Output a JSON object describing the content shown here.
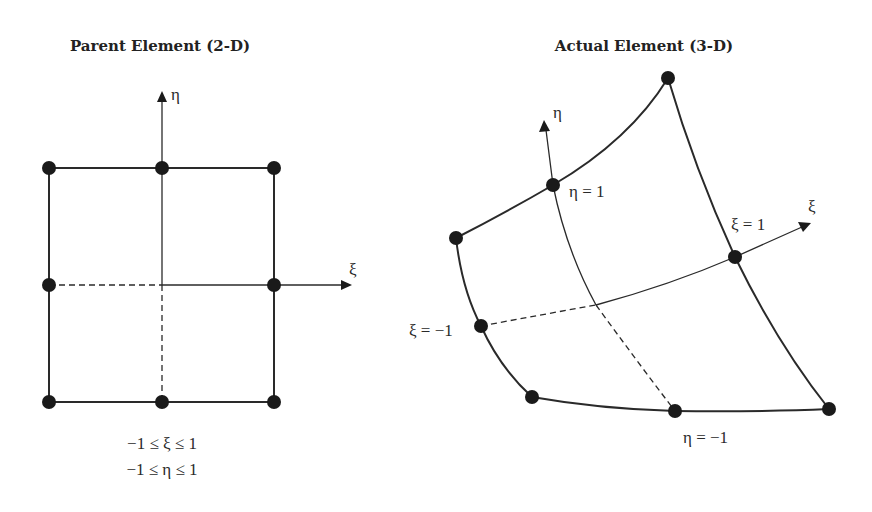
{
  "parent_element": {
    "title": "Parent Element (2-D)",
    "axis_eta_label": "η",
    "axis_xi_label": "ξ",
    "constraint_xi": "−1 ≤ ξ ≤ 1",
    "constraint_eta": "−1 ≤ η ≤ 1",
    "node_count": 8
  },
  "actual_element": {
    "title": "Actual Element (3-D)",
    "axis_eta_label": "η",
    "axis_xi_label": "ξ",
    "label_eta_pos": "η = 1",
    "label_eta_neg": "η = −1",
    "label_xi_pos": "ξ = 1",
    "label_xi_neg": "ξ = −1",
    "node_count": 8
  }
}
